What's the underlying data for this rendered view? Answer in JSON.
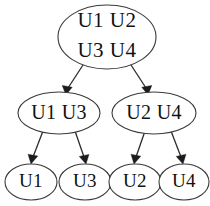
{
  "diagram": {
    "type": "tree",
    "orientation": "top-down",
    "colors": {
      "node_stroke": "#3a3a3a",
      "node_fill": "#ffffff",
      "edge": "#2b2b2b",
      "text": "#111111",
      "background": "#ffffff"
    },
    "nodes": [
      {
        "id": "root",
        "level": 0,
        "shape": "ellipse",
        "cx": 107,
        "cy": 37,
        "rx": 49,
        "ry": 32,
        "lines": [
          "U1  U2",
          "U3  U4"
        ],
        "members": [
          "U1",
          "U2",
          "U3",
          "U4"
        ]
      },
      {
        "id": "mid-left",
        "level": 1,
        "shape": "ellipse",
        "cx": 59,
        "cy": 113,
        "rx": 41,
        "ry": 21,
        "lines": [
          "U1 U3"
        ],
        "members": [
          "U1",
          "U3"
        ]
      },
      {
        "id": "mid-right",
        "level": 1,
        "shape": "ellipse",
        "cx": 154,
        "cy": 113,
        "rx": 42,
        "ry": 21,
        "lines": [
          "U2 U4"
        ],
        "members": [
          "U2",
          "U4"
        ]
      },
      {
        "id": "leaf-u1",
        "level": 2,
        "shape": "ellipse",
        "cx": 31,
        "cy": 182,
        "rx": 26,
        "ry": 18,
        "lines": [
          "U1"
        ],
        "members": [
          "U1"
        ]
      },
      {
        "id": "leaf-u3",
        "level": 2,
        "shape": "ellipse",
        "cx": 85,
        "cy": 182,
        "rx": 26,
        "ry": 18,
        "lines": [
          "U3"
        ],
        "members": [
          "U3"
        ]
      },
      {
        "id": "leaf-u2",
        "level": 2,
        "shape": "ellipse",
        "cx": 135,
        "cy": 182,
        "rx": 26,
        "ry": 18,
        "lines": [
          "U2"
        ],
        "members": [
          "U2"
        ]
      },
      {
        "id": "leaf-u4",
        "level": 2,
        "shape": "ellipse",
        "cx": 184,
        "cy": 182,
        "rx": 25,
        "ry": 18,
        "lines": [
          "U4"
        ],
        "members": [
          "U4"
        ]
      }
    ],
    "edges": [
      {
        "id": "edge-root-midleft",
        "from": "root",
        "to": "mid-left",
        "arrow": true
      },
      {
        "id": "edge-root-midright",
        "from": "root",
        "to": "mid-right",
        "arrow": true
      },
      {
        "id": "edge-midleft-u1",
        "from": "mid-left",
        "to": "leaf-u1",
        "arrow": true
      },
      {
        "id": "edge-midleft-u3",
        "from": "mid-left",
        "to": "leaf-u3",
        "arrow": true
      },
      {
        "id": "edge-midright-u2",
        "from": "mid-right",
        "to": "leaf-u2",
        "arrow": true
      },
      {
        "id": "edge-midright-u4",
        "from": "mid-right",
        "to": "leaf-u4",
        "arrow": true
      }
    ]
  }
}
